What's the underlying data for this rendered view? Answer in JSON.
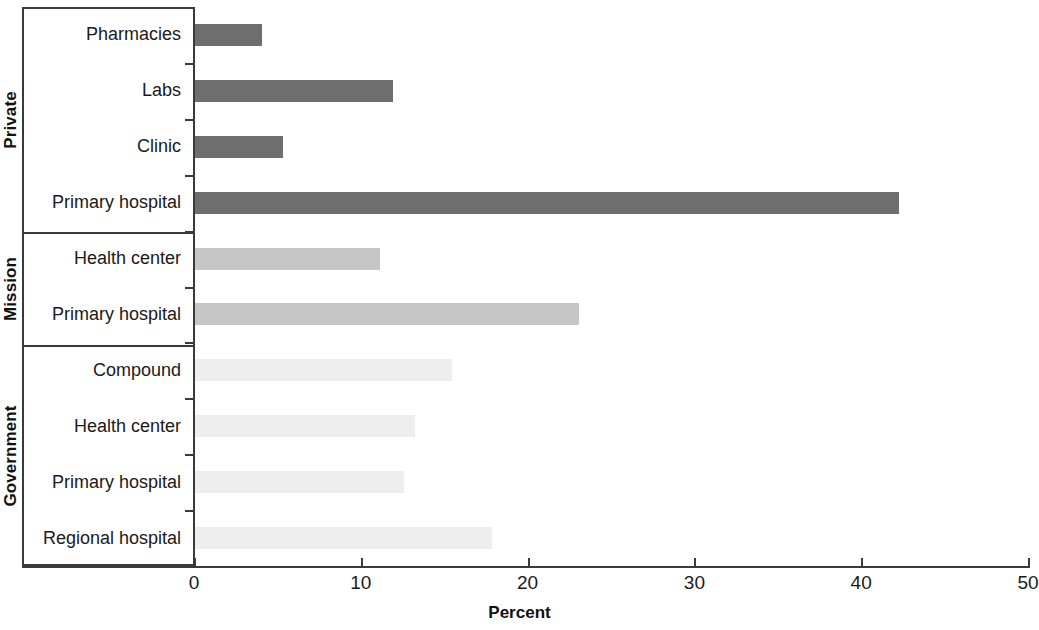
{
  "chart_data": {
    "type": "bar",
    "orientation": "horizontal",
    "title": "",
    "xlabel": "Percent",
    "ylabel": "",
    "xlim": [
      0,
      50
    ],
    "xticks": [
      0,
      10,
      20,
      30,
      40,
      50
    ],
    "xtick_labels": [
      "0",
      "10",
      "20",
      "30",
      "40",
      "50"
    ],
    "grid": false,
    "legend": "none",
    "group_label_axis": "y",
    "groups": [
      {
        "name": "Private",
        "color": "#6e6e6e",
        "categories": [
          "Pharmacies",
          "Labs",
          "Clinic",
          "Primary hospital"
        ],
        "values": [
          4.0,
          11.9,
          5.3,
          42.2
        ]
      },
      {
        "name": "Mission",
        "color": "#c6c6c6",
        "categories": [
          "Health center",
          "Primary hospital"
        ],
        "values": [
          11.1,
          23.0
        ]
      },
      {
        "name": "Government",
        "color": "#eeeeee",
        "categories": [
          "Compound",
          "Health center",
          "Primary hospital",
          "Regional hospital"
        ],
        "values": [
          15.4,
          13.2,
          12.5,
          17.8
        ]
      }
    ],
    "rows": [
      {
        "group": "Private",
        "category": "Pharmacies",
        "value": 4.0,
        "color": "#6e6e6e"
      },
      {
        "group": "Private",
        "category": "Labs",
        "value": 11.9,
        "color": "#6e6e6e"
      },
      {
        "group": "Private",
        "category": "Clinic",
        "value": 5.3,
        "color": "#6e6e6e"
      },
      {
        "group": "Private",
        "category": "Primary hospital",
        "value": 42.2,
        "color": "#6e6e6e"
      },
      {
        "group": "Mission",
        "category": "Health center",
        "value": 11.1,
        "color": "#c6c6c6"
      },
      {
        "group": "Mission",
        "category": "Primary hospital",
        "value": 23.0,
        "color": "#c6c6c6"
      },
      {
        "group": "Government",
        "category": "Compound",
        "value": 15.4,
        "color": "#eeeeee"
      },
      {
        "group": "Government",
        "category": "Health center",
        "value": 13.2,
        "color": "#eeeeee"
      },
      {
        "group": "Government",
        "category": "Primary hospital",
        "value": 12.5,
        "color": "#eeeeee"
      },
      {
        "group": "Government",
        "category": "Regional hospital",
        "value": 17.8,
        "color": "#eeeeee"
      }
    ]
  }
}
